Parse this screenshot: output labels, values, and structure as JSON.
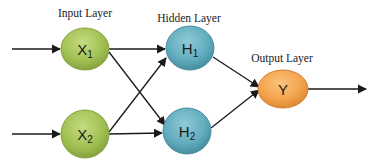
{
  "diagram": {
    "type": "feedforward-neural-network",
    "layers": [
      {
        "label": "Input Layer",
        "color": "#9dbd4d",
        "nodes": [
          {
            "id": "X1",
            "main": "X",
            "sub": "1"
          },
          {
            "id": "X2",
            "main": "X",
            "sub": "2"
          }
        ]
      },
      {
        "label": "Hidden Layer",
        "color": "#5eaabb",
        "nodes": [
          {
            "id": "H1",
            "main": "H",
            "sub": "1"
          },
          {
            "id": "H2",
            "main": "H",
            "sub": "2"
          }
        ]
      },
      {
        "label": "Output Layer",
        "color": "#f2a048",
        "nodes": [
          {
            "id": "Y",
            "main": "Y",
            "sub": ""
          }
        ]
      }
    ],
    "edges": [
      {
        "from": "input",
        "to": "X1"
      },
      {
        "from": "input",
        "to": "X2"
      },
      {
        "from": "X1",
        "to": "H1"
      },
      {
        "from": "X1",
        "to": "H2"
      },
      {
        "from": "X2",
        "to": "H1"
      },
      {
        "from": "X2",
        "to": "H2"
      },
      {
        "from": "H1",
        "to": "Y"
      },
      {
        "from": "H2",
        "to": "Y"
      },
      {
        "from": "Y",
        "to": "output"
      }
    ]
  },
  "labels": {
    "input_layer": "Input Layer",
    "hidden_layer": "Hidden Layer",
    "output_layer": "Output Layer",
    "x1_main": "X",
    "x1_sub": "1",
    "x2_main": "X",
    "x2_sub": "2",
    "h1_main": "H",
    "h1_sub": "1",
    "h2_main": "H",
    "h2_sub": "2",
    "y_main": "Y"
  },
  "colors": {
    "input_node": "#9dbd4d",
    "hidden_node": "#5eaabb",
    "output_node": "#f2a048",
    "edge": "#1a1a1a"
  }
}
